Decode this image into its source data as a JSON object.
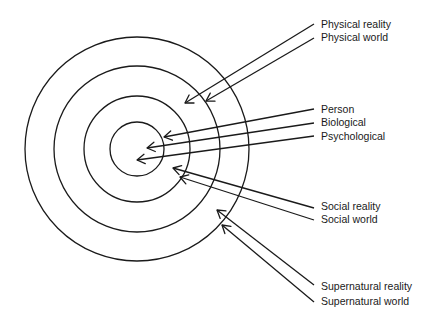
{
  "diagram": {
    "type": "concentric-circles-with-arrows",
    "center": [
      137,
      149
    ],
    "rings": [
      {
        "name": "outer-ring",
        "r": 112
      },
      {
        "name": "second-ring",
        "r": 83
      },
      {
        "name": "third-ring",
        "r": 53
      },
      {
        "name": "inner-ring",
        "r": 27
      }
    ],
    "arrows": [
      {
        "label": "Physical reality",
        "from": [
          314,
          24
        ],
        "to": [
          185,
          103
        ],
        "text_y": 28
      },
      {
        "label": "Physical world",
        "from": [
          314,
          38
        ],
        "to": [
          206,
          101
        ],
        "text_y": 41
      },
      {
        "label": "Person",
        "from": [
          314,
          109
        ],
        "to": [
          164,
          137
        ],
        "text_y": 113
      },
      {
        "label": "Biological",
        "from": [
          314,
          123
        ],
        "to": [
          147,
          148
        ],
        "text_y": 126
      },
      {
        "label": "Psychological",
        "from": [
          314,
          136
        ],
        "to": [
          137,
          160
        ],
        "text_y": 140
      },
      {
        "label": "Social reality",
        "from": [
          314,
          208
        ],
        "to": [
          173,
          168
        ],
        "text_y": 210
      },
      {
        "label": "Social world",
        "from": [
          314,
          220
        ],
        "to": [
          180,
          177
        ],
        "text_y": 223
      },
      {
        "label": "Supernatural reality",
        "from": [
          314,
          285
        ],
        "to": [
          217,
          210
        ],
        "text_y": 290
      },
      {
        "label": "Supernatural world",
        "from": [
          314,
          302
        ],
        "to": [
          222,
          225
        ],
        "text_y": 305
      }
    ],
    "text_x": 321
  },
  "labels": {
    "physical_reality": "Physical reality",
    "physical_world": "Physical world",
    "person": "Person",
    "biological": "Biological",
    "psychological": "Psychological",
    "social_reality": "Social reality",
    "social_world": "Social world",
    "supernatural_reality": "Supernatural reality",
    "supernatural_world": "Supernatural world"
  }
}
